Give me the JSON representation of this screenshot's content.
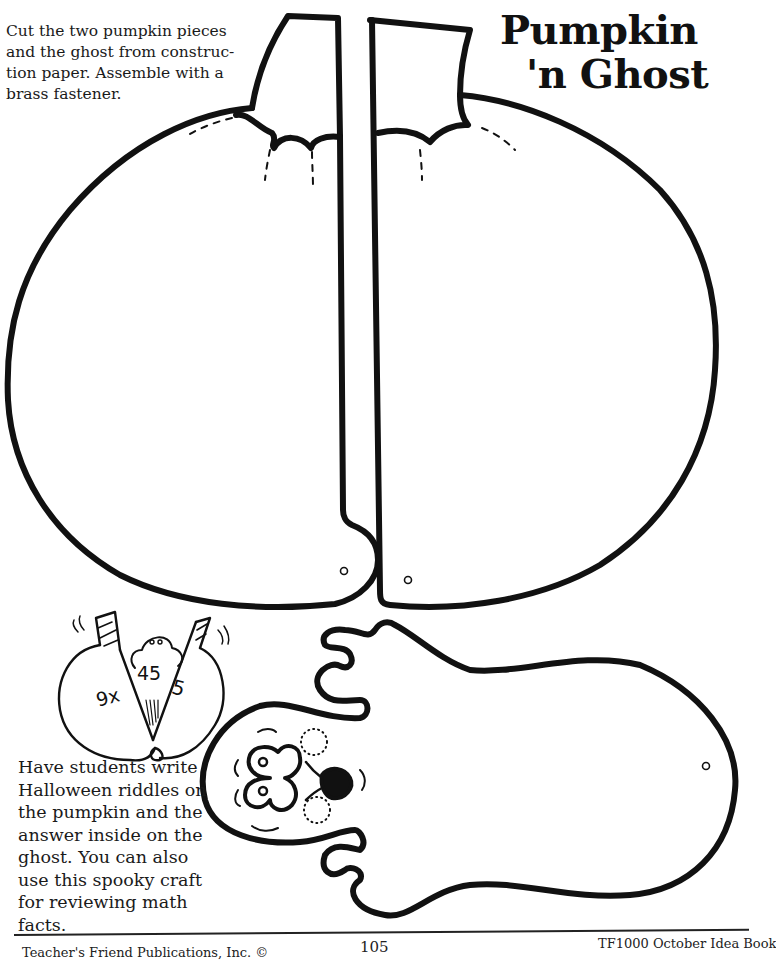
{
  "title": {
    "line1": "Pumpkin",
    "line2": "'n Ghost"
  },
  "instructions": {
    "lines": [
      "Cut the two pumpkin pieces",
      "and the ghost from construc-",
      "tion paper. Assemble with a",
      "brass fastener."
    ]
  },
  "example": {
    "left_text": "9x",
    "center_text": "45",
    "right_text": "5"
  },
  "tip": {
    "lines": [
      "Have students write",
      "Halloween riddles on",
      "the pumpkin and the",
      "answer inside on the",
      "ghost. You can also",
      "use this spooky craft",
      "for reviewing math",
      "facts."
    ]
  },
  "footer": {
    "publisher": "Teacher's Friend Publications, Inc. ©",
    "page_number": "105",
    "book": "TF1000 October Idea Book"
  },
  "colors": {
    "ink": "#111111",
    "paper": "#ffffff"
  }
}
